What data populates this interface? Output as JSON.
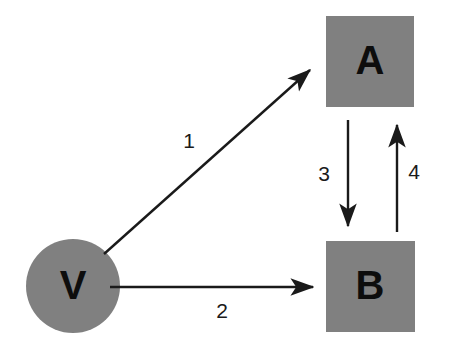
{
  "diagram": {
    "background_color": "#ffffff",
    "node_fill_color": "#808080",
    "node_text_color": "#0d0d0d",
    "edge_color": "#1a1a1a",
    "nodes": [
      {
        "id": "node-a",
        "label": "A",
        "shape": "square",
        "x": 326,
        "y": 16,
        "width": 88,
        "height": 91,
        "font_size": 40
      },
      {
        "id": "node-b",
        "label": "B",
        "shape": "square",
        "x": 326,
        "y": 241,
        "width": 89,
        "height": 91,
        "font_size": 40
      },
      {
        "id": "node-v",
        "label": "V",
        "shape": "circle",
        "cx": 73,
        "cy": 286,
        "rx": 47,
        "ry": 47,
        "font_size": 40
      }
    ],
    "edges": [
      {
        "id": "edge-1",
        "label": "1",
        "from": "node-v",
        "to": "node-a",
        "x1": 104,
        "y1": 254,
        "x2": 314,
        "y2": 67,
        "label_x": 189,
        "label_y": 142,
        "font_size": 21
      },
      {
        "id": "edge-2",
        "label": "2",
        "from": "node-v",
        "to": "node-b",
        "x1": 110,
        "y1": 287,
        "x2": 317,
        "y2": 287,
        "label_x": 222,
        "label_y": 312,
        "font_size": 21
      },
      {
        "id": "edge-3",
        "label": "3",
        "from": "node-a",
        "to": "node-b",
        "x1": 348,
        "y1": 120,
        "x2": 348,
        "y2": 230,
        "label_x": 324,
        "label_y": 175,
        "font_size": 21
      },
      {
        "id": "edge-4",
        "label": "4",
        "from": "node-b",
        "to": "node-a",
        "x1": 397,
        "y1": 232,
        "x2": 397,
        "y2": 121,
        "label_x": 414,
        "label_y": 173,
        "font_size": 21
      }
    ]
  }
}
